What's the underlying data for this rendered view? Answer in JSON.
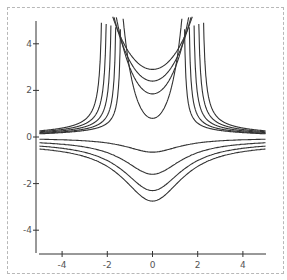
{
  "chart_data": {
    "type": "line",
    "title": "",
    "xlabel": "",
    "ylabel": "",
    "xlim": [
      -5,
      5
    ],
    "ylim": [
      -5,
      5
    ],
    "grid": false,
    "legend": null,
    "x_ticks": [
      -4,
      -2,
      0,
      2,
      4
    ],
    "y_ticks": [
      -4,
      -2,
      0,
      2,
      4
    ],
    "x_tick_labels": [
      "-4",
      "-2",
      "0",
      "2",
      "4"
    ],
    "y_tick_labels": [
      "4",
      "2",
      "0",
      "-2",
      "-4"
    ],
    "line_color": "#333333",
    "series": [
      {
        "name": "upper-u-1",
        "kind": "cosh",
        "y0": 2.9,
        "k": 0.67
      },
      {
        "name": "upper-u-2",
        "kind": "cosh",
        "y0": 2.4,
        "k": 0.82
      },
      {
        "name": "upper-u-3",
        "kind": "cosh",
        "y0": 1.85,
        "k": 1.05
      },
      {
        "name": "upper-u-4",
        "kind": "cosh",
        "y0": 0.8,
        "k": 1.95
      },
      {
        "name": "hyper-1",
        "kind": "hyper",
        "a": 0.9,
        "x0": 1.35,
        "b": 0.05
      },
      {
        "name": "hyper-2",
        "kind": "hyper",
        "a": 1.05,
        "x0": 1.55,
        "b": 0.05
      },
      {
        "name": "hyper-3",
        "kind": "hyper",
        "a": 1.2,
        "x0": 1.75,
        "b": 0.06
      },
      {
        "name": "hyper-4",
        "kind": "hyper",
        "a": 1.35,
        "x0": 1.95,
        "b": 0.07
      },
      {
        "name": "hyper-5",
        "kind": "hyper",
        "a": 1.5,
        "x0": 2.15,
        "b": 0.08
      },
      {
        "name": "lower-1",
        "kind": "dip",
        "c": 0.65,
        "w": 1.6,
        "tail": -0.05
      },
      {
        "name": "lower-2",
        "kind": "dip",
        "c": 1.6,
        "w": 1.7,
        "tail": -0.12
      },
      {
        "name": "lower-3",
        "kind": "dip",
        "c": 2.3,
        "w": 1.75,
        "tail": -0.2
      },
      {
        "name": "lower-4",
        "kind": "dip",
        "c": 2.75,
        "w": 1.8,
        "tail": -0.28
      }
    ]
  }
}
